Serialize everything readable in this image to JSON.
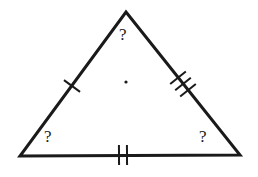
{
  "figure": {
    "kind": "geometry-diagram",
    "shape": "triangle",
    "background_color": "#ffffff",
    "stroke_color": "#1a1a1a",
    "canvas": {
      "width": 258,
      "height": 177
    },
    "vertices": {
      "apex": {
        "x": 126,
        "y": 12,
        "label": "?"
      },
      "bottom_left": {
        "x": 20,
        "y": 156,
        "label": "?"
      },
      "bottom_right": {
        "x": 240,
        "y": 155,
        "label": "?"
      }
    },
    "outline_stroke_width": 3,
    "sides": [
      {
        "name": "left-side",
        "from": "apex",
        "to": "bottom_left",
        "tick_count": 1,
        "tick_center": {
          "x": 72,
          "y": 86
        }
      },
      {
        "name": "right-side",
        "from": "apex",
        "to": "bottom_right",
        "tick_count": 3,
        "tick_center": {
          "x": 183,
          "y": 84
        }
      },
      {
        "name": "bottom-side",
        "from": "bottom_left",
        "to": "bottom_right",
        "tick_count": 2,
        "tick_center": {
          "x": 123,
          "y": 155
        }
      }
    ],
    "tick_stroke_width": 2,
    "tick_length": 20,
    "center_dot": {
      "x": 126,
      "y": 82,
      "radius": 1.6
    },
    "angle_labels": {
      "apex": "?",
      "bottom_left": "?",
      "bottom_right": "?"
    }
  }
}
